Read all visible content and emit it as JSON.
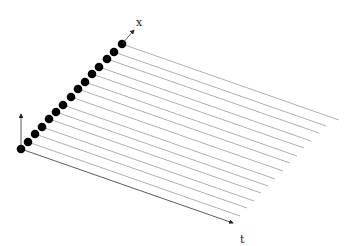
{
  "diagram": {
    "type": "spacetime-worldlines",
    "axes": {
      "x_label": "x",
      "t_label": "t"
    },
    "dot_count": 15,
    "dots": [
      [
        21,
        149
      ],
      [
        28,
        142
      ],
      [
        35,
        134
      ],
      [
        42,
        127
      ],
      [
        49,
        119
      ],
      [
        56,
        112
      ],
      [
        63,
        105
      ],
      [
        71,
        97
      ],
      [
        78,
        89
      ],
      [
        85,
        82
      ],
      [
        92,
        74
      ],
      [
        99,
        67
      ],
      [
        107,
        59
      ],
      [
        114,
        52
      ],
      [
        122,
        44
      ]
    ],
    "line_dx": 212,
    "line_dy": 74,
    "colors": {
      "dot": "#000000",
      "line": "#9a9a9a",
      "axis": "#333333"
    }
  }
}
